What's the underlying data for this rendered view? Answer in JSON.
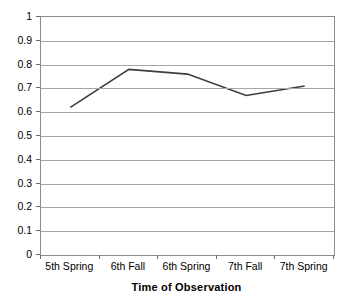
{
  "chart_data": {
    "type": "line",
    "title": "",
    "subtitle": "",
    "xlabel": "Time of Observation",
    "ylabel": "",
    "categories": [
      "5th Spring",
      "6th Fall",
      "6th Spring",
      "7th Fall",
      "7th Spring"
    ],
    "values": [
      0.62,
      0.78,
      0.76,
      0.67,
      0.71
    ],
    "series": [
      {
        "name": "",
        "values": [
          0.62,
          0.78,
          0.76,
          0.67,
          0.71
        ]
      }
    ],
    "ylim": [
      0,
      1
    ],
    "ytick_labels": [
      "0",
      "0.1",
      "0.2",
      "0.3",
      "0.4",
      "0.5",
      "0.6",
      "0.7",
      "0.8",
      "0.9",
      "1"
    ],
    "ytick_values": [
      0,
      0.1,
      0.2,
      0.3,
      0.4,
      0.5,
      0.6,
      0.7,
      0.8,
      0.9,
      1
    ],
    "grid": true,
    "grid_axis": "y",
    "legend": false,
    "legend_position": "none",
    "markers": false,
    "line_color": "#3d3d3d",
    "line_width": 1.6,
    "plot_border_color": "#8c8c8c",
    "gridline_color": "#a6a6a6",
    "background_color": "#ffffff",
    "text_color": "#000000",
    "annotations": []
  }
}
